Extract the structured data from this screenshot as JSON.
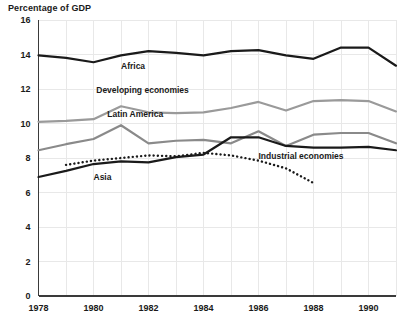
{
  "chart_data": {
    "type": "line",
    "title": "Percentage of GDP",
    "xlabel": "",
    "ylabel": "",
    "xlim": [
      1978,
      1991
    ],
    "ylim": [
      0,
      16
    ],
    "ytick_labels": [
      "0",
      "2",
      "4",
      "6",
      "8",
      "10",
      "12",
      "14",
      "16"
    ],
    "yticks": [
      0,
      2,
      4,
      6,
      8,
      10,
      12,
      14,
      16
    ],
    "xtick_labels": [
      "1978",
      "1980",
      "1982",
      "1984",
      "1986",
      "1988",
      "1990"
    ],
    "xticks": [
      1978,
      1980,
      1982,
      1984,
      1986,
      1988,
      1990
    ],
    "grid": true,
    "legend_position": "inline-annotations",
    "x": [
      1978,
      1979,
      1980,
      1981,
      1982,
      1983,
      1984,
      1985,
      1986,
      1987,
      1988,
      1989,
      1990,
      1991
    ],
    "series": [
      {
        "name": "Africa",
        "color": "#1a1a1a",
        "style": "solid",
        "width": 2.2,
        "label_x": 1981.0,
        "label_y": 13.15,
        "values": [
          13.95,
          13.8,
          13.55,
          13.95,
          14.2,
          14.1,
          13.95,
          14.2,
          14.25,
          13.95,
          13.75,
          14.4,
          14.4,
          13.35
        ]
      },
      {
        "name": "Developing economies",
        "color": "#9a9a9a",
        "style": "solid",
        "width": 2.2,
        "label_x": 1980.1,
        "label_y": 11.75,
        "values": [
          10.1,
          10.15,
          10.25,
          11.0,
          10.65,
          10.6,
          10.65,
          10.9,
          11.25,
          10.75,
          11.3,
          11.35,
          11.3,
          10.7
        ]
      },
      {
        "name": "Latin America",
        "color": "#8a8a8a",
        "style": "solid",
        "width": 2.2,
        "label_x": 1980.5,
        "label_y": 10.4,
        "values": [
          8.45,
          8.8,
          9.1,
          9.9,
          8.85,
          9.0,
          9.05,
          8.85,
          9.55,
          8.7,
          9.35,
          9.45,
          9.45,
          8.85
        ]
      },
      {
        "name": "Asia",
        "color": "#1a1a1a",
        "style": "solid",
        "width": 2.2,
        "label_x": 1980.0,
        "label_y": 6.75,
        "values": [
          6.9,
          7.25,
          7.65,
          7.8,
          7.75,
          8.05,
          8.2,
          9.2,
          9.2,
          8.7,
          8.6,
          8.6,
          8.65,
          8.45
        ]
      },
      {
        "name": "Industrial economies",
        "color": "#1a1a1a",
        "style": "dotted",
        "width": 2.4,
        "label_x": 1986.0,
        "label_y": 7.95,
        "values": [
          null,
          7.6,
          7.85,
          8.0,
          8.15,
          8.1,
          8.3,
          8.15,
          7.85,
          7.4,
          6.55,
          null,
          null,
          null
        ]
      }
    ]
  }
}
